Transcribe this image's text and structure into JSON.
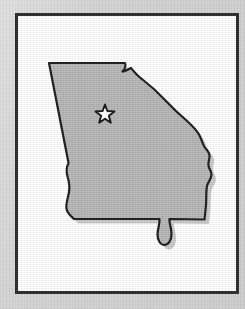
{
  "figure": {
    "caption": "",
    "width": 245,
    "height": 309
  },
  "colors": {
    "mat_background": "#d4d4d4",
    "frame_border": "#2a2a2a",
    "plate_background": "#ffffff",
    "state_fill": "#b9b9b9",
    "state_outline": "#1a1a1a",
    "drop_shadow": "#c6c6c6",
    "marker_fill": "#ffffff",
    "marker_outline": "#141414"
  },
  "map": {
    "region_name": "Georgia",
    "region_label": "",
    "outline_stroke_width": 2.2,
    "has_drop_shadow": true,
    "markers": [
      {
        "name": "capital-star",
        "icon": "star-icon",
        "label": "",
        "x": 92,
        "y": 101,
        "size": 19,
        "points": 5
      }
    ]
  },
  "frame": {
    "x": 15,
    "y": 13,
    "width": 224,
    "height": 281,
    "border_width": 3
  },
  "chart_data": {
    "type": "map",
    "projection": "unspecified",
    "regions": [
      {
        "name": "Georgia",
        "fill": "#b9b9b9",
        "stroke": "#1a1a1a"
      }
    ],
    "points": [
      {
        "name": "capital-star",
        "marker": "star",
        "x": 92,
        "y": 101
      }
    ],
    "legend": [],
    "annotations": [],
    "grid": false,
    "xlabel": "",
    "ylabel": ""
  }
}
